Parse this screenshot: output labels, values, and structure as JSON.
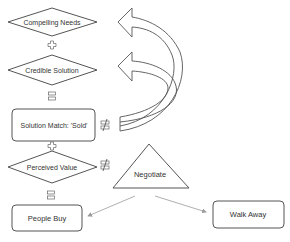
{
  "diagram": {
    "nodes": {
      "compelling_needs": {
        "label": "Compelling Needs",
        "shape": "diamond"
      },
      "credible_solution": {
        "label": "Credible Solution",
        "shape": "diamond"
      },
      "solution_match": {
        "label": "Solution Match: 'Sold'",
        "shape": "rounded-rect"
      },
      "perceived_value": {
        "label": "Perceived Value",
        "shape": "diamond"
      },
      "negotiate": {
        "label": "Negotiate",
        "shape": "triangle"
      },
      "people_buy": {
        "label": "People Buy",
        "shape": "rounded-rect"
      },
      "walk_away": {
        "label": "Walk Away",
        "shape": "rounded-rect"
      }
    },
    "operators": [
      {
        "id": "op1",
        "symbol": "plus",
        "between": [
          "Compelling Needs",
          "Credible Solution"
        ]
      },
      {
        "id": "op2",
        "symbol": "equals",
        "between": [
          "Credible Solution",
          "Solution Match: 'Sold'"
        ]
      },
      {
        "id": "op3",
        "symbol": "not-equal",
        "beside": "Solution Match: 'Sold'"
      },
      {
        "id": "op4",
        "symbol": "plus",
        "between": [
          "Solution Match: 'Sold'",
          "Perceived Value"
        ]
      },
      {
        "id": "op5",
        "symbol": "not-equal",
        "beside": "Perceived Value"
      },
      {
        "id": "op6",
        "symbol": "equals",
        "between": [
          "Perceived Value",
          "People Buy"
        ]
      }
    ],
    "edges": [
      {
        "from": "Solution Match: 'Sold'",
        "to": "Compelling Needs",
        "style": "curved-block-arrow"
      },
      {
        "from": "Solution Match: 'Sold'",
        "to": "Credible Solution",
        "style": "curved-block-arrow"
      },
      {
        "from": "Negotiate",
        "to": "People Buy",
        "style": "thin-arrow"
      },
      {
        "from": "Negotiate",
        "to": "Walk Away",
        "style": "thin-arrow"
      }
    ],
    "colors": {
      "stroke": "#555555",
      "text": "#333333",
      "thin_arrow": "#9a9a9a",
      "background": "#ffffff"
    }
  }
}
